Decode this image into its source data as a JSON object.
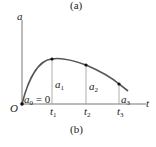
{
  "captions": {
    "top": "(a)",
    "bottom": "(b)"
  },
  "axes": {
    "y_label": "a",
    "x_label": "t",
    "origin_label": "O"
  },
  "points": [
    {
      "t_label": "t",
      "t_sub": "1",
      "a_label": "a",
      "a_sub": "1"
    },
    {
      "t_label": "t",
      "t_sub": "2",
      "a_label": "a",
      "a_sub": "2"
    },
    {
      "t_label": "t",
      "t_sub": "3",
      "a_label": "a",
      "a_sub": "3"
    }
  ],
  "initial": {
    "label": "a",
    "sub": "0",
    "rest": " = 0"
  },
  "colors": {
    "curve": "#555555",
    "axis": "#777777",
    "point": "#111111"
  }
}
